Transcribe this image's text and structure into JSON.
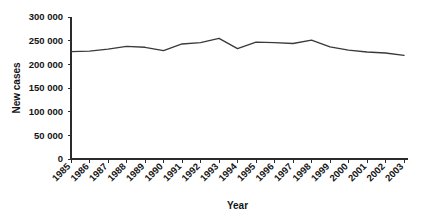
{
  "chart_data": {
    "type": "line",
    "title": "",
    "xlabel": "Year",
    "ylabel": "New cases",
    "grid": false,
    "legend": "none",
    "ylim": [
      0,
      300000
    ],
    "yticks": [
      0,
      50000,
      100000,
      150000,
      200000,
      250000,
      300000
    ],
    "ytick_labels": [
      "0",
      "50 000",
      "100 000",
      "150 000",
      "200 000",
      "250 000",
      "300 000"
    ],
    "categories": [
      "1985",
      "1986",
      "1987",
      "1988",
      "1989",
      "1990",
      "1991",
      "1992",
      "1993",
      "1994",
      "1995",
      "1996",
      "1997",
      "1998",
      "1999",
      "2000",
      "2001",
      "2002",
      "2003"
    ],
    "series": [
      {
        "name": "New cases",
        "values": [
          227000,
          228000,
          232000,
          238000,
          236000,
          229000,
          243000,
          246000,
          255000,
          233000,
          247000,
          246000,
          244000,
          251000,
          237000,
          230000,
          226000,
          224000,
          219000
        ]
      }
    ]
  },
  "axes": {
    "y_title": "New cases",
    "x_title": "Year"
  }
}
